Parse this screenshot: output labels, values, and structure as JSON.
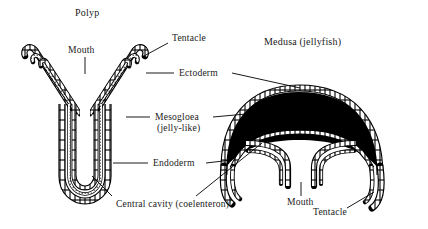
{
  "figure": {
    "type": "biological-diagram",
    "background_color": "#ffffff",
    "ink_color": "#000000",
    "titles": {
      "polyp": "Polyp",
      "medusa": "Medusa (jellyfish)"
    },
    "labels": {
      "mouth_polyp": "Mouth",
      "tentacle_polyp": "Tentacle",
      "ectoderm": "Ectoderm",
      "mesogloea_line1": "Mesogloea",
      "mesogloea_line2": "(jelly-like)",
      "endoderm": "Endoderm",
      "central_cavity": "Central cavity (coelenteron)",
      "mouth_medusa": "Mouth",
      "tentacle_medusa": "Tentacle"
    },
    "layers": [
      {
        "name": "Ectoderm",
        "rendering": "outer cell row (brick pattern)"
      },
      {
        "name": "Mesogloea",
        "rendering": "middle jelly layer; stippled in polyp, solid black in medusa bell"
      },
      {
        "name": "Endoderm",
        "rendering": "inner cell row (brick pattern)"
      }
    ],
    "structures": [
      {
        "name": "polyp",
        "shape": "U-shaped tube with two upward tentacle arms, mouth at top centre, closed rounded base"
      },
      {
        "name": "medusa",
        "shape": "domed bell with thick black mesogloea, marginal tentacles curving downward, central manubrium bearing the mouth"
      }
    ]
  }
}
